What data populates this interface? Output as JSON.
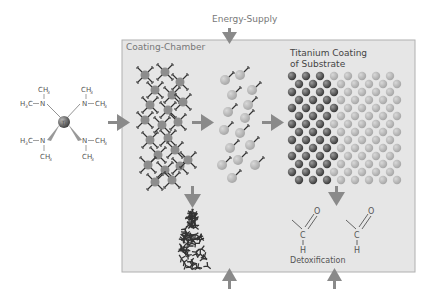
{
  "labels": {
    "energy_supply": "Energy-Supply",
    "coating_chamber": "Coating-Chamber",
    "titanium_coating_line1": "Titanium Coating",
    "titanium_coating_line2": "of Substrate",
    "detoxification": "Detoxification"
  },
  "precursor": {
    "center_atom": "Ti",
    "groups": [
      {
        "left": "H3C",
        "n": "N",
        "top": "CH3"
      },
      {
        "right": "CH3",
        "n": "N",
        "top": "CH3"
      },
      {
        "left": "H3C",
        "n": "N",
        "bottom": "CH3"
      },
      {
        "right": "CH3",
        "n": "N",
        "bottom": "CH3"
      }
    ]
  },
  "formaldehyde": {
    "atoms": [
      "C",
      "O",
      "H"
    ]
  },
  "colors": {
    "chamber_bg": "#e6e6e6",
    "chamber_border": "#aaaaaa",
    "arrow": "#8a8a8a",
    "sphere_dark": "#5a5a5a",
    "sphere_light": "#b5b5b5",
    "text": "#666666"
  }
}
